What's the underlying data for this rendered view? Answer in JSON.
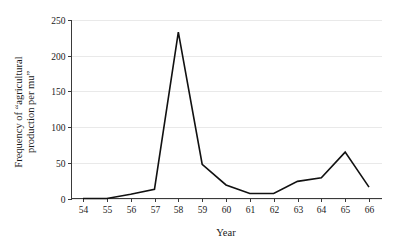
{
  "chart_data": {
    "type": "line",
    "title": "",
    "subtitle": "",
    "xlabel": "Year",
    "ylabel": "Frequency of \"agricultural production per mu\"",
    "ylabel_line1": "Frequency of “agricultural",
    "ylabel_line2": "production per mu”",
    "categories": [
      "54",
      "55",
      "56",
      "57",
      "58",
      "59",
      "60",
      "61",
      "62",
      "63",
      "64",
      "65",
      "66"
    ],
    "x": [
      54,
      55,
      56,
      57,
      58,
      59,
      60,
      61,
      62,
      63,
      64,
      65,
      66
    ],
    "values": [
      0,
      0,
      6,
      13,
      233,
      48,
      19,
      7,
      7,
      24,
      29,
      65,
      16
    ],
    "series": [
      {
        "name": "Frequency",
        "values": [
          0,
          0,
          6,
          13,
          233,
          48,
          19,
          7,
          7,
          24,
          29,
          65,
          16
        ],
        "color": "#111111"
      }
    ],
    "xlim": [
      54,
      66
    ],
    "ylim": [
      0,
      250
    ],
    "ytick_labels": [
      "0",
      "50",
      "100",
      "150",
      "200",
      "250"
    ],
    "yticks": [
      0,
      50,
      100,
      150,
      200,
      250
    ],
    "xtick_labels": [
      "54",
      "55",
      "56",
      "57",
      "58",
      "59",
      "60",
      "61",
      "62",
      "63",
      "64",
      "65",
      "66"
    ],
    "grid": "horizontal",
    "grid_color": "#e9e9e9",
    "legend": "none",
    "legend_position": "none",
    "background_color": "#ffffff",
    "axis_color": "#3a3a3a",
    "annotations": []
  }
}
